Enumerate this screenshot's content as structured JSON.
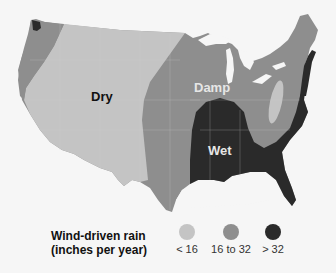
{
  "colors": {
    "dry": "#c4c4c4",
    "damp": "#8e8e8e",
    "wet": "#2a2a2a",
    "background": "#f6f6f6",
    "state_lines": "#d0d0d0"
  },
  "regions": {
    "dry": {
      "label": "Dry"
    },
    "damp": {
      "label": "Damp"
    },
    "wet": {
      "label": "Wet"
    }
  },
  "legend": {
    "title_line1": "Wind-driven rain",
    "title_line2": "(inches per year)",
    "items": [
      {
        "label": "< 16",
        "category": "dry"
      },
      {
        "label": "16 to 32",
        "category": "damp"
      },
      {
        "label": "> 32",
        "category": "wet"
      }
    ]
  }
}
